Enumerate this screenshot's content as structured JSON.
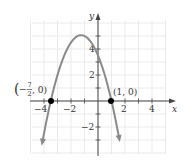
{
  "chart_data": {
    "type": "line",
    "title": "",
    "xlabel": "x",
    "ylabel": "y",
    "xlim": [
      -4.8,
      5
    ],
    "ylim": [
      -3.8,
      6.3
    ],
    "grid": true,
    "x_ticks": [
      -4,
      -2,
      2,
      4
    ],
    "y_ticks": [
      4,
      2,
      -2
    ],
    "series": [
      {
        "name": "parabola",
        "equation": "y = -(x + 7/2)(x - 1)",
        "x": [
          -4.2,
          -3.5,
          -3,
          -2,
          -1.25,
          0,
          1,
          1.6
        ],
        "values": [
          -3.64,
          0,
          2,
          4.5,
          5.06,
          3.5,
          0,
          -3.06
        ],
        "color": "#8a8a8a",
        "arrows_at_ends": true
      }
    ],
    "points": [
      {
        "x": -3.5,
        "y": 0,
        "label_parts": [
          "−",
          "7",
          "2",
          ", 0"
        ],
        "label": "(−7/2, 0)"
      },
      {
        "x": 1,
        "y": 0,
        "label": "(1, 0)"
      }
    ],
    "annotations": [
      "(−7/2, 0)",
      "(1, 0)"
    ]
  },
  "labels": {
    "x_axis": "x",
    "y_axis": "y",
    "tick_neg4": "−4",
    "tick_neg2": "−2",
    "tick_2": "2",
    "tick_4": "4",
    "ytick_4": "4",
    "ytick_2": "2",
    "ytick_neg2": "−2",
    "point_right": "(1, 0)",
    "point_left_minus": "−",
    "point_left_num": "7",
    "point_left_den": "2",
    "point_left_tail": ", 0)",
    "point_left_open": "("
  },
  "colors": {
    "grid": "#e6e6e6",
    "axis": "#444444",
    "curve": "#8a8a8a",
    "point": "#000000"
  }
}
